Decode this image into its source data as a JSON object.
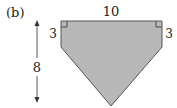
{
  "figure": {
    "label": "(b)",
    "shape": "pentagon (rectangle with triangular bottom)",
    "fill_color": "#b8b8b8",
    "stroke_color": "#555555",
    "dimensions": {
      "top": "10",
      "left_side": "3",
      "right_side": "3",
      "total_height": "8"
    },
    "right_angle_markers": [
      "top-left",
      "top-right"
    ]
  }
}
